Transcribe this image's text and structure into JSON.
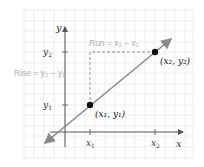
{
  "diagram": {
    "axes": {
      "x_label": "x",
      "y_label": "y"
    },
    "ticks": {
      "x": [
        {
          "label": "x",
          "sub": "1"
        },
        {
          "label": "x",
          "sub": "2"
        }
      ],
      "y": [
        {
          "label": "y",
          "sub": "1"
        },
        {
          "label": "y",
          "sub": "2"
        }
      ]
    },
    "points": [
      {
        "label": "(x₁, y₁)"
      },
      {
        "label": "(x₂, y₂)"
      }
    ],
    "annotations": {
      "run": "Run = x₂ − x₁",
      "rise": "Rise = y₂ − y₁"
    },
    "colors": {
      "grid": "#e6e6e6",
      "axis": "#555555",
      "line": "#8a8a8a",
      "annotation": "#b0b0b0",
      "point": "#111111"
    }
  }
}
